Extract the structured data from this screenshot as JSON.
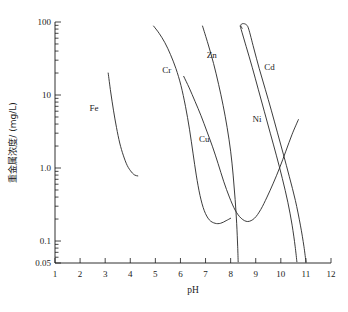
{
  "chart_data": {
    "type": "line",
    "title": "",
    "xlabel": "pH",
    "ylabel": "重金属浓度/ (mg/L)",
    "xlim": [
      1,
      12
    ],
    "ylim": [
      0.05,
      100
    ],
    "yscale": "log",
    "xscale": "linear",
    "grid": false,
    "legend_position": "inline-annotations",
    "xticks": [
      "1",
      "2",
      "3",
      "4",
      "5",
      "6",
      "7",
      "8",
      "9",
      "10",
      "11",
      "12"
    ],
    "xtick_values": [
      1,
      2,
      3,
      4,
      5,
      6,
      7,
      8,
      9,
      10,
      11,
      12
    ],
    "yticks": [
      "0.05",
      "0.1",
      "1.0",
      "10",
      "100"
    ],
    "ytick_values": [
      0.05,
      0.1,
      1.0,
      10,
      100
    ],
    "yminor_values": [
      0.06,
      0.07,
      0.08,
      0.09,
      0.2,
      0.3,
      0.4,
      0.5,
      0.6,
      0.7,
      0.8,
      0.9,
      2,
      3,
      4,
      5,
      6,
      7,
      8,
      9,
      20,
      30,
      40,
      50,
      60,
      70,
      80,
      90
    ],
    "series": [
      {
        "name": "Fe",
        "label": "Fe",
        "label_at": {
          "ph": 2.55,
          "conc": 6.0
        },
        "points": [
          [
            3.12,
            20.0
          ],
          [
            3.22,
            11.0
          ],
          [
            3.33,
            6.2
          ],
          [
            3.45,
            3.6
          ],
          [
            3.58,
            2.2
          ],
          [
            3.72,
            1.5
          ],
          [
            3.88,
            1.08
          ],
          [
            4.05,
            0.88
          ],
          [
            4.18,
            0.8
          ],
          [
            4.3,
            0.78
          ]
        ]
      },
      {
        "name": "Cr",
        "label": "Cr",
        "label_at": {
          "ph": 5.45,
          "conc": 20.0
        },
        "points": [
          [
            4.93,
            88.0
          ],
          [
            5.15,
            70.0
          ],
          [
            5.38,
            52.0
          ],
          [
            5.6,
            36.0
          ],
          [
            5.82,
            23.0
          ],
          [
            6.02,
            13.5
          ],
          [
            6.2,
            7.0
          ],
          [
            6.36,
            3.4
          ],
          [
            6.5,
            1.6
          ],
          [
            6.63,
            0.8
          ],
          [
            6.78,
            0.42
          ],
          [
            6.95,
            0.26
          ],
          [
            7.15,
            0.195
          ],
          [
            7.38,
            0.175
          ],
          [
            7.6,
            0.175
          ],
          [
            7.82,
            0.19
          ],
          [
            8.0,
            0.205
          ]
        ]
      },
      {
        "name": "Cu",
        "label": "Cu",
        "label_at": {
          "ph": 6.95,
          "conc": 2.3
        },
        "points": [
          [
            6.13,
            18.0
          ],
          [
            6.35,
            12.5
          ],
          [
            6.58,
            8.2
          ],
          [
            6.82,
            5.2
          ],
          [
            7.05,
            3.2
          ],
          [
            7.28,
            1.95
          ],
          [
            7.5,
            1.15
          ],
          [
            7.72,
            0.66
          ],
          [
            7.95,
            0.4
          ],
          [
            8.18,
            0.265
          ],
          [
            8.42,
            0.205
          ],
          [
            8.68,
            0.185
          ],
          [
            8.95,
            0.205
          ],
          [
            9.2,
            0.27
          ],
          [
            9.45,
            0.4
          ],
          [
            9.7,
            0.62
          ],
          [
            9.95,
            1.0
          ],
          [
            10.2,
            1.7
          ],
          [
            10.45,
            2.9
          ],
          [
            10.7,
            4.6
          ]
        ]
      },
      {
        "name": "Zn",
        "label": "Zn",
        "label_at": {
          "ph": 7.25,
          "conc": 32.0
        },
        "points": [
          [
            6.88,
            88.0
          ],
          [
            7.1,
            50.0
          ],
          [
            7.32,
            27.0
          ],
          [
            7.52,
            14.0
          ],
          [
            7.7,
            7.2
          ],
          [
            7.86,
            3.6
          ],
          [
            8.0,
            1.7
          ],
          [
            8.1,
            0.8
          ],
          [
            8.18,
            0.37
          ],
          [
            8.24,
            0.175
          ],
          [
            8.28,
            0.085
          ],
          [
            8.3,
            0.052
          ]
        ]
      },
      {
        "name": "Ni",
        "label": "Ni",
        "label_at": {
          "ph": 9.05,
          "conc": 4.3
        },
        "points": [
          [
            8.38,
            88.0
          ],
          [
            8.62,
            46.0
          ],
          [
            8.86,
            24.0
          ],
          [
            9.1,
            12.0
          ],
          [
            9.34,
            6.0
          ],
          [
            9.58,
            3.0
          ],
          [
            9.82,
            1.5
          ],
          [
            10.06,
            0.72
          ],
          [
            10.28,
            0.34
          ],
          [
            10.45,
            0.165
          ],
          [
            10.57,
            0.085
          ],
          [
            10.64,
            0.052
          ]
        ]
      },
      {
        "name": "Cd",
        "label": "Cd",
        "label_at": {
          "ph": 9.55,
          "conc": 22.0
        },
        "points": [
          [
            8.46,
            82.0
          ],
          [
            8.4,
            90.0
          ],
          [
            8.48,
            95.0
          ],
          [
            8.62,
            92.0
          ],
          [
            8.72,
            80.0
          ],
          [
            8.92,
            44.0
          ],
          [
            9.14,
            23.0
          ],
          [
            9.38,
            12.0
          ],
          [
            9.62,
            6.2
          ],
          [
            9.86,
            3.1
          ],
          [
            10.1,
            1.55
          ],
          [
            10.34,
            0.76
          ],
          [
            10.58,
            0.36
          ],
          [
            10.78,
            0.165
          ],
          [
            10.92,
            0.085
          ],
          [
            11.0,
            0.052
          ]
        ]
      }
    ]
  },
  "caption": ""
}
